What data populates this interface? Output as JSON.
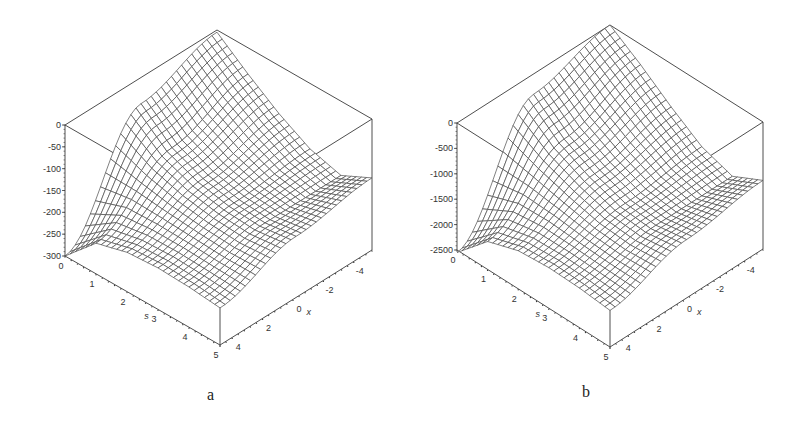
{
  "chart_data": [
    {
      "id": "a",
      "type": "surface3d",
      "caption": "a",
      "title": "",
      "axes": {
        "s": {
          "label": "s",
          "range": [
            0,
            5
          ],
          "ticks": [
            "0",
            "1",
            "2",
            "3",
            "4",
            "5"
          ]
        },
        "x": {
          "label": "x",
          "range": [
            -5,
            5
          ],
          "ticks": [
            "4",
            "2",
            "0",
            "-2",
            "-4"
          ]
        },
        "z": {
          "label": "",
          "range": [
            -300,
            0
          ],
          "ticks": [
            "0",
            "-50",
            "-100",
            "-150",
            "-200",
            "-250",
            "-300"
          ]
        }
      },
      "grid": false,
      "render": "wireframe mesh",
      "description": "Surface peaks near 0 at s=0 along back edge, descends to about -300 at s=0,x=5 corner; saddle-like valley near center; front corner (s=5,x=5) around -215",
      "sample_values": {
        "s": [
          0,
          1,
          2,
          3,
          4,
          5
        ],
        "x": [
          5,
          0,
          -5
        ],
        "z": [
          [
            -300,
            -60,
            -5
          ],
          [
            -230,
            -120,
            -60
          ],
          [
            -210,
            -150,
            -110
          ],
          [
            -205,
            -165,
            -150
          ],
          [
            -208,
            -170,
            -170
          ],
          [
            -215,
            -160,
            -135
          ]
        ]
      }
    },
    {
      "id": "b",
      "type": "surface3d",
      "caption": "b",
      "title": "",
      "axes": {
        "s": {
          "label": "s",
          "range": [
            0,
            5
          ],
          "ticks": [
            "0",
            "1",
            "2",
            "3",
            "4",
            "5"
          ]
        },
        "x": {
          "label": "x",
          "range": [
            -5,
            5
          ],
          "ticks": [
            "4",
            "2",
            "0",
            "-2",
            "-4"
          ]
        },
        "z": {
          "label": "",
          "range": [
            -2500,
            0
          ],
          "ticks": [
            "0",
            "-500",
            "-1000",
            "-1500",
            "-2000",
            "-2500"
          ]
        }
      },
      "grid": false,
      "render": "wireframe mesh",
      "description": "Same shape as (a) scaled roughly 8x in z; minimum about -2500 at s=0,x=5 corner",
      "sample_values": {
        "s": [
          0,
          1,
          2,
          3,
          4,
          5
        ],
        "x": [
          5,
          0,
          -5
        ],
        "z": [
          [
            -2550,
            -400,
            0
          ],
          [
            -1950,
            -900,
            -400
          ],
          [
            -1750,
            -1200,
            -850
          ],
          [
            -1700,
            -1400,
            -1250
          ],
          [
            -1720,
            -1450,
            -1450
          ],
          [
            -1780,
            -1350,
            -1150
          ]
        ]
      }
    }
  ],
  "geometry": {
    "a": {
      "apex": [
        217,
        30
      ],
      "left_top": [
        65,
        125
      ],
      "left_bottom": [
        67,
        256
      ],
      "front_bottom": [
        220,
        345
      ],
      "right_bottom": [
        368,
        253
      ],
      "right_top": [
        368,
        123
      ],
      "front_top": [
        220,
        217
      ]
    },
    "b": {
      "apex": [
        210,
        25
      ],
      "left_top": [
        57,
        123
      ],
      "left_bottom": [
        57,
        250
      ],
      "front_bottom": [
        210,
        347
      ],
      "right_bottom": [
        365,
        253
      ],
      "right_top": [
        365,
        117
      ],
      "front_top": [
        210,
        212
      ]
    }
  },
  "colors": {
    "line": "#3a3a3a",
    "mesh": "#4a4a4a",
    "background": "#ffffff"
  }
}
